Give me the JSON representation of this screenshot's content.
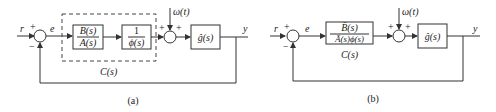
{
  "diagram_a": {
    "caption": "(a)",
    "input": "r",
    "error": "e",
    "output": "y",
    "sum1_plus": "+",
    "sum1_minus": "−",
    "block1_num": "B(s)",
    "block1_den": "A(s)",
    "block2_num": "1",
    "block2_den": "ϕ(s)",
    "controller_label": "C(s)",
    "disturbance": "ω(t)",
    "sum2_plus_left": "+",
    "sum2_plus_right": "+",
    "plant": "ĝ(s)"
  },
  "diagram_b": {
    "caption": "(b)",
    "input": "r",
    "error": "e",
    "output": "y",
    "sum1_plus": "+",
    "sum1_minus": "−",
    "block_num": "B̄(s)",
    "block_den": "Ā(s)ϕ(s)",
    "controller_label": "C(s)",
    "disturbance": "ω(t)",
    "sum2_plus_left": "+",
    "sum2_plus_right": "+",
    "plant": "ĝ(s)"
  }
}
